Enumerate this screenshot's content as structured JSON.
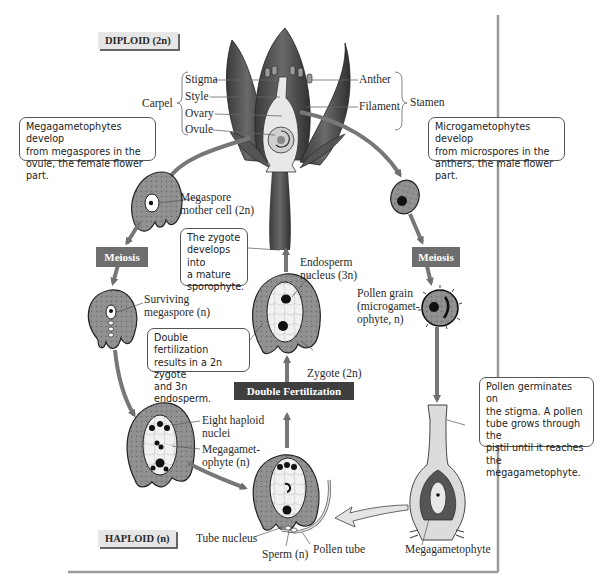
{
  "phase_labels": {
    "diploid": "DIPLOID (2n)",
    "haploid": "HAPLOID (n)"
  },
  "flower_parts": {
    "carpel": "Carpel",
    "stigma": "Stigma",
    "style": "Style",
    "ovary": "Ovary",
    "ovule": "Ovule",
    "anther": "Anther",
    "filament": "Filament",
    "stamen": "Stamen"
  },
  "callouts": {
    "megagametophytes": "Megagametophytes develop\nfrom megaspores in the\novule, the female flower part.",
    "microgametophytes": "Microgametophytes develop\nfrom microspores in the\nanthers, the male flower part.",
    "zygote_develops": "The zygote\ndevelops into\na mature\nsporophyte.",
    "double_fertilization": "Double fertilization\nresults in a 2n zygote\nand 3n endosperm.",
    "pollen_germinates": "Pollen germinates on\nthe stigma. A pollen\ntube grows through the\npistil until it reaches the\nmegagametophyte."
  },
  "process_boxes": {
    "meiosis_left": "Meiosis",
    "meiosis_right": "Meiosis",
    "double_fertilization": "Double Fertilization"
  },
  "structure_labels": {
    "megaspore_mother_cell_1": "Megaspore",
    "megaspore_mother_cell_2": "mother cell (2n)",
    "surviving_megaspore_1": "Surviving",
    "surviving_megaspore_2": "megaspore (n)",
    "endosperm_nucleus_1": "Endosperm",
    "endosperm_nucleus_2": "nucleus (3n)",
    "zygote": "Zygote (2n)",
    "pollen_grain_1": "Pollen grain",
    "pollen_grain_2": "(microgamet-",
    "pollen_grain_3": "ophyte, n)",
    "eight_haploid_nuclei_1": "Eight haploid",
    "eight_haploid_nuclei_2": "nuclei",
    "megagametophyte_n_1": "Megagamet-",
    "megagametophyte_n_2": "ophyte (n)",
    "tube_nucleus": "Tube nucleus",
    "sperm": "Sperm (n)",
    "pollen_tube": "Pollen tube",
    "megagametophyte": "Megagametophyte"
  },
  "colors": {
    "tissue_gray": "#8a8a8a",
    "arrow_gray": "#7a7a7a",
    "meiosis_box": "#6e6e6e",
    "fertilization_box": "#3f3f3f",
    "tag_bg": "#e6e6e6",
    "border": "#9a9a9a"
  }
}
